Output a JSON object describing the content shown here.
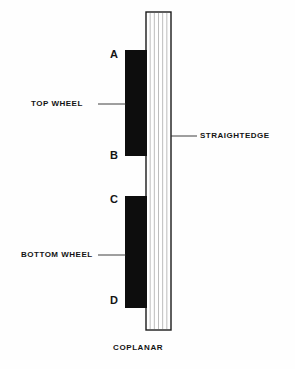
{
  "figure": {
    "caption": "COPLANAR",
    "background_color": "#fefefe",
    "ink_color": "#141414"
  },
  "parts": {
    "straightedge": {
      "label": "STRAIGHTEDGE",
      "fill_color": "#ffffff",
      "stroke_color": "#1a1a1a",
      "hatch_color": "#bdbdbd",
      "hatch_line_count": 5,
      "x": 146,
      "y": 12,
      "width": 25,
      "height": 318
    },
    "top_wheel": {
      "label": "TOP WHEEL",
      "fill_color": "#0d0d0d",
      "x": 125,
      "y": 50,
      "width": 22,
      "height": 106,
      "top_point": "A",
      "bottom_point": "B"
    },
    "bottom_wheel": {
      "label": "BOTTOM WHEEL",
      "fill_color": "#0d0d0d",
      "x": 125,
      "y": 196,
      "width": 22,
      "height": 112,
      "top_point": "C",
      "bottom_point": "D"
    }
  },
  "points": {
    "a": "A",
    "b": "B",
    "c": "C",
    "d": "D"
  },
  "leaders": {
    "top_wheel": {
      "x1": 98,
      "y1": 104,
      "x2": 126,
      "y2": 104
    },
    "bottom_wheel": {
      "x1": 98,
      "y1": 255,
      "x2": 126,
      "y2": 255
    },
    "straightedge": {
      "x1": 171,
      "y1": 136,
      "x2": 197,
      "y2": 136
    },
    "stroke_color": "#2b2b2b",
    "stroke_width": 0.9
  }
}
